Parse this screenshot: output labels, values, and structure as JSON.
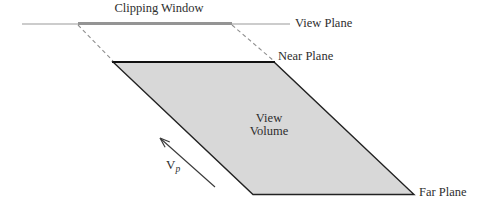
{
  "diagram": {
    "title_context": "View volume diagram",
    "labels": {
      "clipping_window": "Clipping Window",
      "view_plane": "View Plane",
      "near_plane": "Near Plane",
      "view_volume_line1": "View",
      "view_volume_line2": "Volume",
      "far_plane": "Far Plane",
      "vector_base": "V",
      "vector_sub": "p"
    },
    "colors": {
      "background": "#ffffff",
      "view_volume_fill": "#d8d8d8",
      "view_volume_outline": "#222222",
      "near_plane_edge": "#111111",
      "view_plane_line": "#999999",
      "clipping_window_line": "#949494",
      "dashed_projector": "#8f8f8f",
      "arrow": "#3a3a3a",
      "text": "#2e2e2e"
    }
  }
}
